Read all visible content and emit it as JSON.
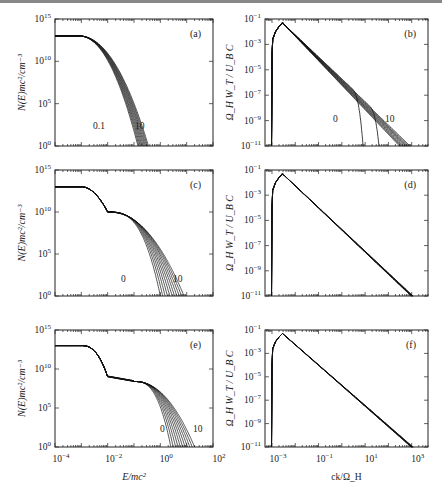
{
  "figure": {
    "panels": [
      "(a)",
      "(b)",
      "(c)",
      "(d)",
      "(e)",
      "(f)"
    ],
    "left_ylabel": "N(E)mc²/cm⁻³",
    "right_ylabel": "Ω_H W_T / U_B C",
    "left_xlabel": "E/mc²",
    "right_xlabel": "ck/Ω_H",
    "left_yticks": [
      "10^0",
      "10^5",
      "10^10",
      "10^15"
    ],
    "right_yticks": [
      "10^-11",
      "10^-9",
      "10^-7",
      "10^-5",
      "10^-3",
      "10^-1"
    ],
    "left_xticks": [
      "10^-4",
      "10^-2",
      "10^0",
      "10^2"
    ],
    "right_xticks": [
      "10^-3",
      "10^-1",
      "10^1",
      "10^3"
    ],
    "curve_labels": {
      "a": [
        "0.1",
        "10"
      ],
      "b": [
        "0",
        "10"
      ],
      "c": [
        "0",
        "10"
      ],
      "e": [
        "0",
        "10"
      ]
    }
  },
  "chart_data": [
    {
      "panel": "(a)",
      "type": "line",
      "xlabel": "E/mc²",
      "ylabel": "N(E)mc²/cm⁻³",
      "xscale": "log",
      "yscale": "log",
      "xlim": [
        0.0001,
        100.0
      ],
      "ylim": [
        1,
        1000000000000000.0
      ],
      "series_label_range": [
        "0.1",
        "10"
      ],
      "description": "Family of ~11 curves: flat plateau ~1e13 up to ~1e-3, then steep cutoffs reaching 1e0 at E/mc² ≈ 0.1–0.3"
    },
    {
      "panel": "(b)",
      "type": "line",
      "xlabel": "ck/Ω_H",
      "ylabel": "Ω_H W_T/U_B C",
      "xscale": "log",
      "yscale": "log",
      "xlim": [
        0.0005,
        5000.0
      ],
      "ylim": [
        1e-11,
        0.1
      ],
      "series_label_range": [
        "0",
        "10"
      ],
      "description": "Sharp rise near ck/Ω_H≈1e-3 to peak ~5e-2 at ≈3e-3, power-law decline to 1e-11 at ~1e3; curves 0 and early ones cut off at ~10 and ~50"
    },
    {
      "panel": "(c)",
      "type": "line",
      "xlabel": "E/mc²",
      "ylabel": "N(E)mc²/cm⁻³",
      "xscale": "log",
      "yscale": "log",
      "xlim": [
        0.0001,
        100.0
      ],
      "ylim": [
        1,
        1000000000000000.0
      ],
      "series_label_range": [
        "0",
        "10"
      ],
      "description": "Plateau ~1e13, knee near 1e-2, cutoffs from E≈1 (curve 0) to E≈10 (curve 10)"
    },
    {
      "panel": "(d)",
      "type": "line",
      "xlabel": "ck/Ω_H",
      "ylabel": "Ω_H W_T/U_B C",
      "xscale": "log",
      "yscale": "log",
      "xlim": [
        0.0005,
        5000.0
      ],
      "ylim": [
        1e-11,
        0.1
      ],
      "description": "Peak ~5e-2 at ≈3e-3, single power-law decline to 1e-11 near 1e3"
    },
    {
      "panel": "(e)",
      "type": "line",
      "xlabel": "E/mc²",
      "ylabel": "N(E)mc²/cm⁻³",
      "xscale": "log",
      "yscale": "log",
      "xlim": [
        0.0001,
        100.0
      ],
      "ylim": [
        1,
        1000000000000000.0
      ],
      "series_label_range": [
        "0",
        "10"
      ],
      "description": "Plateau ~1e13, dip near 1e-2 to ~1e9, shoulder, cutoffs E≈3 (0) to E≈20 (10)"
    },
    {
      "panel": "(f)",
      "type": "line",
      "xlabel": "ck/Ω_H",
      "ylabel": "Ω_H W_T/U_B C",
      "xscale": "log",
      "yscale": "log",
      "xlim": [
        0.0005,
        5000.0
      ],
      "ylim": [
        1e-11,
        0.1
      ],
      "description": "Peak ~5e-2 at ≈3e-3, power-law decline to 1e-11 near 1e3"
    }
  ]
}
